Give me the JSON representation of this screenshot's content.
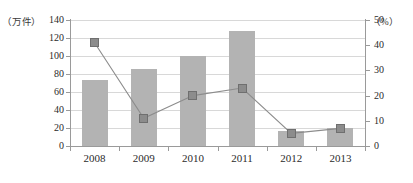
{
  "chart_data": {
    "type": "bar",
    "title": "",
    "xlabel": "",
    "categories": [
      "2008",
      "2009",
      "2010",
      "2011",
      "2012",
      "2013"
    ],
    "series": [
      {
        "name": "件数",
        "type": "bar",
        "axis": "left",
        "values": [
          73,
          86,
          100,
          128,
          17,
          20
        ]
      },
      {
        "name": "增速",
        "type": "line",
        "axis": "right",
        "values": [
          41,
          11,
          20,
          23,
          5,
          7
        ]
      }
    ],
    "left_axis": {
      "unit_label": "（万件）",
      "ticks": [
        0,
        20,
        40,
        60,
        80,
        100,
        120,
        140
      ],
      "ylim": [
        0,
        140
      ],
      "ylabel": ""
    },
    "right_axis": {
      "unit_label": "（%）",
      "ticks": [
        0,
        10,
        20,
        30,
        40,
        50
      ],
      "ylim": [
        0,
        50
      ],
      "ylabel": ""
    },
    "grid": true,
    "legend": "none",
    "colors": {
      "bar": "#b3b3b3",
      "line": "#8c8c8c",
      "marker": "#8c8c8c",
      "grid": "#d8d8d8",
      "axis": "#9a9a9a",
      "text": "#2b2b2b"
    }
  }
}
